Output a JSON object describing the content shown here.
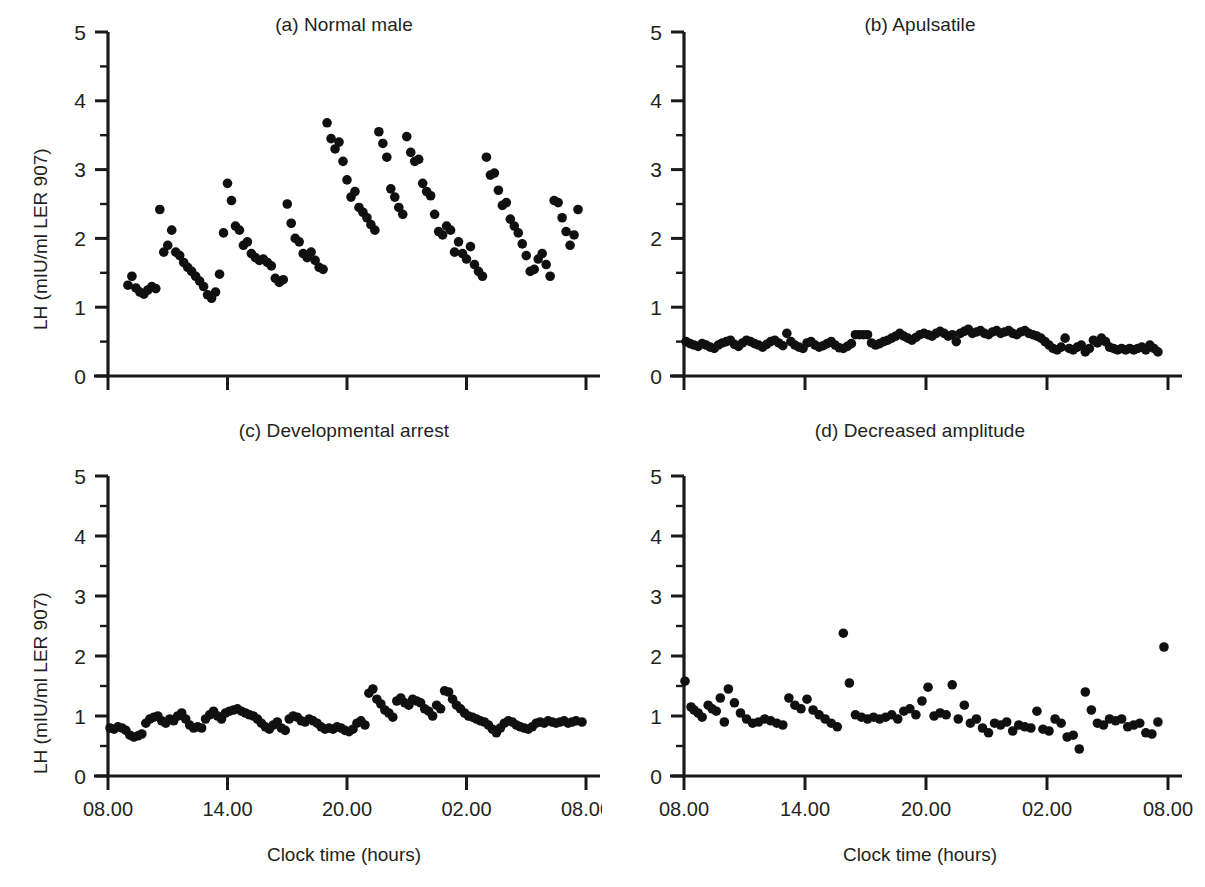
{
  "figure": {
    "background": "#ffffff",
    "marker_color": "#101010",
    "axis_color": "#1a1a1a",
    "text_color": "#231f20"
  },
  "axes": {
    "ylabel": "LH (mIU/ml LER 907)",
    "xlabel": "Clock time (hours)",
    "ytick_labels": [
      "0",
      "1",
      "2",
      "3",
      "4",
      "5"
    ],
    "xtick_labels": [
      "08.00",
      "14.00",
      "20.00",
      "02.00",
      "08.00"
    ],
    "ylim": [
      0,
      5
    ],
    "xlim": [
      8,
      32
    ],
    "xticks": [
      8,
      14,
      20,
      26,
      32
    ],
    "yticks": [
      0,
      1,
      2,
      3,
      4,
      5
    ],
    "yminor": [
      0.5,
      1.5,
      2.5,
      3.5,
      4.5
    ],
    "grid": false
  },
  "chart_data": [
    {
      "type": "scatter",
      "panel": "a",
      "title": "(a) Normal male",
      "xlabel": "Clock time (hours)",
      "ylabel": "LH (mIU/ml LER 907)",
      "xlim": [
        8,
        32
      ],
      "ylim": [
        0,
        5
      ],
      "x": [
        9.0,
        9.2,
        9.4,
        9.6,
        9.8,
        10.0,
        10.2,
        10.4,
        10.6,
        10.8,
        11.0,
        11.2,
        11.4,
        11.6,
        11.8,
        12.0,
        12.2,
        12.4,
        12.6,
        12.8,
        13.0,
        13.2,
        13.4,
        13.6,
        13.8,
        14.0,
        14.2,
        14.4,
        14.6,
        14.8,
        15.0,
        15.2,
        15.4,
        15.6,
        15.8,
        16.0,
        16.2,
        16.4,
        16.6,
        16.8,
        17.0,
        17.2,
        17.4,
        17.6,
        17.8,
        18.0,
        18.2,
        18.4,
        18.6,
        18.8,
        19.0,
        19.2,
        19.4,
        19.6,
        19.8,
        20.0,
        20.2,
        20.4,
        20.6,
        20.8,
        21.0,
        21.2,
        21.4,
        21.6,
        21.8,
        22.0,
        22.2,
        22.4,
        22.6,
        22.8,
        23.0,
        23.2,
        23.4,
        23.6,
        23.8,
        24.0,
        24.2,
        24.4,
        24.6,
        24.8,
        25.0,
        25.2,
        25.4,
        25.6,
        25.8,
        26.0,
        26.2,
        26.4,
        26.6,
        26.8,
        27.0,
        27.2,
        27.4,
        27.6,
        27.8,
        28.0,
        28.2,
        28.4,
        28.6,
        28.8,
        29.0,
        29.2,
        29.4,
        29.6,
        29.8,
        30.0,
        30.2,
        30.4,
        30.6,
        30.8,
        31.0,
        31.2,
        31.4,
        31.6
      ],
      "y": [
        1.32,
        1.45,
        1.28,
        1.22,
        1.19,
        1.25,
        1.3,
        1.27,
        2.42,
        1.8,
        1.9,
        2.12,
        1.8,
        1.75,
        1.65,
        1.58,
        1.52,
        1.45,
        1.38,
        1.3,
        1.18,
        1.13,
        1.22,
        1.48,
        2.08,
        2.8,
        2.55,
        2.18,
        2.12,
        1.9,
        1.95,
        1.78,
        1.72,
        1.68,
        1.7,
        1.65,
        1.6,
        1.42,
        1.36,
        1.4,
        2.5,
        2.22,
        2.0,
        1.95,
        1.78,
        1.72,
        1.8,
        1.68,
        1.58,
        1.55,
        3.68,
        3.45,
        3.3,
        3.4,
        3.12,
        2.85,
        2.6,
        2.68,
        2.45,
        2.38,
        2.3,
        2.2,
        2.12,
        3.55,
        3.38,
        3.18,
        2.72,
        2.6,
        2.45,
        2.35,
        3.48,
        3.25,
        3.12,
        3.15,
        2.8,
        2.68,
        2.62,
        2.35,
        2.1,
        2.05,
        2.18,
        2.12,
        1.8,
        1.95,
        1.78,
        1.7,
        1.88,
        1.62,
        1.52,
        1.45,
        3.18,
        2.92,
        2.95,
        2.7,
        2.48,
        2.52,
        2.28,
        2.18,
        2.08,
        1.92,
        1.75,
        1.52,
        1.55,
        1.7,
        1.78,
        1.62,
        1.45,
        2.55,
        2.52,
        2.3,
        2.1,
        1.9,
        2.05,
        2.42
      ]
    },
    {
      "type": "scatter",
      "panel": "b",
      "title": "(b) Apulsatile",
      "xlabel": "Clock time (hours)",
      "ylabel": "LH (mIU/ml LER 907)",
      "xlim": [
        8,
        32
      ],
      "ylim": [
        0,
        5
      ],
      "x": [
        8.1,
        8.3,
        8.5,
        8.7,
        8.9,
        9.1,
        9.3,
        9.5,
        9.7,
        9.9,
        10.1,
        10.3,
        10.5,
        10.7,
        10.9,
        11.1,
        11.3,
        11.5,
        11.7,
        11.9,
        12.1,
        12.3,
        12.5,
        12.7,
        12.9,
        13.1,
        13.3,
        13.5,
        13.7,
        13.9,
        14.1,
        14.3,
        14.5,
        14.7,
        14.9,
        15.1,
        15.3,
        15.5,
        15.7,
        15.9,
        16.1,
        16.3,
        16.5,
        16.7,
        16.9,
        17.1,
        17.3,
        17.5,
        17.7,
        17.9,
        18.1,
        18.3,
        18.5,
        18.7,
        18.9,
        19.1,
        19.3,
        19.5,
        19.7,
        19.9,
        20.1,
        20.3,
        20.5,
        20.7,
        20.9,
        21.1,
        21.3,
        21.5,
        21.7,
        21.9,
        22.1,
        22.3,
        22.5,
        22.7,
        22.9,
        23.1,
        23.3,
        23.5,
        23.7,
        23.9,
        24.1,
        24.3,
        24.5,
        24.7,
        24.9,
        25.1,
        25.3,
        25.5,
        25.7,
        25.9,
        26.1,
        26.3,
        26.5,
        26.7,
        26.9,
        27.1,
        27.3,
        27.5,
        27.7,
        27.9,
        28.1,
        28.3,
        28.5,
        28.7,
        28.9,
        29.1,
        29.3,
        29.5,
        29.7,
        29.9,
        30.1,
        30.3,
        30.5,
        30.7,
        30.9,
        31.1,
        31.3,
        31.5
      ],
      "y": [
        0.5,
        0.47,
        0.45,
        0.43,
        0.47,
        0.45,
        0.42,
        0.4,
        0.45,
        0.48,
        0.5,
        0.52,
        0.46,
        0.43,
        0.48,
        0.52,
        0.5,
        0.47,
        0.45,
        0.42,
        0.46,
        0.5,
        0.52,
        0.48,
        0.44,
        0.62,
        0.5,
        0.45,
        0.42,
        0.4,
        0.48,
        0.5,
        0.45,
        0.42,
        0.44,
        0.47,
        0.5,
        0.45,
        0.41,
        0.4,
        0.43,
        0.47,
        0.6,
        0.6,
        0.6,
        0.6,
        0.48,
        0.45,
        0.47,
        0.5,
        0.52,
        0.55,
        0.58,
        0.62,
        0.58,
        0.55,
        0.52,
        0.56,
        0.6,
        0.62,
        0.6,
        0.58,
        0.62,
        0.65,
        0.62,
        0.58,
        0.6,
        0.5,
        0.62,
        0.65,
        0.68,
        0.62,
        0.64,
        0.66,
        0.62,
        0.6,
        0.64,
        0.66,
        0.62,
        0.64,
        0.66,
        0.62,
        0.6,
        0.64,
        0.66,
        0.62,
        0.6,
        0.58,
        0.55,
        0.5,
        0.45,
        0.4,
        0.38,
        0.42,
        0.55,
        0.4,
        0.38,
        0.42,
        0.45,
        0.35,
        0.4,
        0.52,
        0.48,
        0.55,
        0.5,
        0.42,
        0.4,
        0.38,
        0.4,
        0.38,
        0.4,
        0.38,
        0.4,
        0.42,
        0.38,
        0.45,
        0.4,
        0.35
      ]
    },
    {
      "type": "scatter",
      "panel": "c",
      "title": "(c) Developmental arrest",
      "xlabel": "Clock time (hours)",
      "ylabel": "LH (mIU/ml LER 907)",
      "xlim": [
        8,
        32
      ],
      "ylim": [
        0,
        5
      ],
      "x": [
        8.1,
        8.3,
        8.5,
        8.7,
        8.9,
        9.1,
        9.3,
        9.5,
        9.7,
        9.9,
        10.1,
        10.3,
        10.5,
        10.7,
        10.9,
        11.1,
        11.3,
        11.5,
        11.7,
        11.9,
        12.1,
        12.3,
        12.5,
        12.7,
        12.9,
        13.1,
        13.3,
        13.5,
        13.7,
        13.9,
        14.1,
        14.3,
        14.5,
        14.7,
        14.9,
        15.1,
        15.3,
        15.5,
        15.7,
        15.9,
        16.1,
        16.3,
        16.5,
        16.7,
        16.9,
        17.1,
        17.3,
        17.5,
        17.7,
        17.9,
        18.1,
        18.3,
        18.5,
        18.7,
        18.9,
        19.1,
        19.3,
        19.5,
        19.7,
        19.9,
        20.1,
        20.3,
        20.5,
        20.7,
        20.9,
        21.1,
        21.3,
        21.5,
        21.7,
        21.9,
        22.1,
        22.3,
        22.5,
        22.7,
        22.9,
        23.1,
        23.3,
        23.5,
        23.7,
        23.9,
        24.1,
        24.3,
        24.5,
        24.7,
        24.9,
        25.1,
        25.3,
        25.5,
        25.7,
        25.9,
        26.1,
        26.3,
        26.5,
        26.7,
        26.9,
        27.1,
        27.3,
        27.5,
        27.7,
        27.9,
        28.1,
        28.3,
        28.5,
        28.7,
        28.9,
        29.1,
        29.3,
        29.5,
        29.7,
        29.9,
        30.1,
        30.3,
        30.5,
        30.7,
        30.9,
        31.1,
        31.3,
        31.5,
        31.8
      ],
      "y": [
        0.8,
        0.78,
        0.82,
        0.8,
        0.76,
        0.68,
        0.65,
        0.67,
        0.7,
        0.88,
        0.95,
        0.98,
        1.0,
        0.92,
        0.88,
        0.95,
        0.92,
        1.0,
        1.05,
        0.95,
        0.85,
        0.8,
        0.82,
        0.8,
        0.95,
        1.02,
        1.08,
        1.0,
        0.95,
        1.05,
        1.08,
        1.1,
        1.12,
        1.08,
        1.05,
        1.02,
        1.0,
        0.95,
        0.88,
        0.82,
        0.78,
        0.85,
        0.9,
        0.8,
        0.76,
        0.95,
        1.0,
        0.98,
        0.92,
        0.9,
        0.95,
        0.92,
        0.88,
        0.82,
        0.78,
        0.8,
        0.78,
        0.82,
        0.8,
        0.76,
        0.74,
        0.78,
        0.88,
        0.92,
        0.85,
        1.38,
        1.45,
        1.28,
        1.2,
        1.1,
        1.05,
        0.98,
        1.25,
        1.3,
        1.22,
        1.18,
        1.28,
        1.25,
        1.22,
        1.12,
        1.08,
        1.0,
        1.18,
        1.12,
        1.42,
        1.4,
        1.28,
        1.18,
        1.12,
        1.05,
        1.0,
        0.98,
        0.95,
        0.92,
        0.9,
        0.85,
        0.78,
        0.72,
        0.8,
        0.88,
        0.92,
        0.9,
        0.85,
        0.82,
        0.8,
        0.78,
        0.82,
        0.88,
        0.9,
        0.88,
        0.92,
        0.9,
        0.88,
        0.9,
        0.92,
        0.88,
        0.9,
        0.92,
        0.9
      ]
    },
    {
      "type": "scatter",
      "panel": "d",
      "title": "(d) Decreased amplitude",
      "xlabel": "Clock time (hours)",
      "ylabel": "LH (mIU/ml LER 907)",
      "xlim": [
        8,
        32
      ],
      "ylim": [
        0,
        5
      ],
      "x": [
        8.05,
        8.35,
        8.5,
        8.7,
        8.9,
        9.2,
        9.4,
        9.6,
        9.8,
        10.0,
        10.2,
        10.5,
        10.8,
        11.1,
        11.4,
        11.7,
        12.0,
        12.3,
        12.6,
        12.9,
        13.2,
        13.5,
        13.8,
        14.1,
        14.4,
        14.7,
        15.0,
        15.3,
        15.6,
        15.9,
        16.2,
        16.5,
        16.8,
        17.1,
        17.4,
        17.7,
        18.0,
        18.3,
        18.6,
        18.9,
        19.2,
        19.5,
        19.8,
        20.1,
        20.4,
        20.7,
        21.0,
        21.3,
        21.6,
        21.9,
        22.2,
        22.5,
        22.8,
        23.1,
        23.4,
        23.7,
        24.0,
        24.3,
        24.6,
        24.9,
        25.2,
        25.5,
        25.8,
        26.1,
        26.4,
        26.7,
        27.0,
        27.3,
        27.6,
        27.9,
        28.2,
        28.5,
        28.8,
        29.1,
        29.4,
        29.7,
        30.0,
        30.3,
        30.6,
        30.9,
        31.2,
        31.5,
        31.8
      ],
      "y": [
        1.58,
        1.15,
        1.1,
        1.05,
        0.98,
        1.18,
        1.12,
        1.08,
        1.3,
        0.9,
        1.45,
        1.22,
        1.05,
        0.95,
        0.88,
        0.9,
        0.95,
        0.92,
        0.88,
        0.85,
        1.3,
        1.18,
        1.12,
        1.28,
        1.1,
        1.02,
        0.95,
        0.88,
        0.82,
        2.38,
        1.55,
        1.02,
        0.98,
        0.95,
        0.98,
        0.95,
        0.98,
        1.02,
        0.95,
        1.08,
        1.12,
        1.02,
        1.25,
        1.48,
        1.0,
        1.05,
        1.02,
        1.52,
        0.95,
        1.18,
        0.88,
        0.95,
        0.8,
        0.72,
        0.88,
        0.85,
        0.9,
        0.75,
        0.85,
        0.82,
        0.8,
        1.08,
        0.78,
        0.75,
        0.95,
        0.88,
        0.65,
        0.68,
        0.45,
        1.4,
        1.1,
        0.88,
        0.85,
        0.95,
        0.92,
        0.95,
        0.82,
        0.85,
        0.88,
        0.72,
        0.7,
        0.9,
        2.15
      ]
    }
  ]
}
